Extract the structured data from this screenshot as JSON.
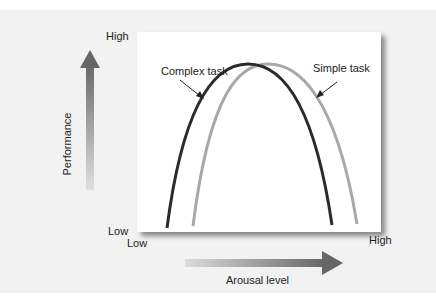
{
  "diagram": {
    "y_axis": {
      "label": "Performance",
      "high": "High",
      "low": "Low"
    },
    "x_axis": {
      "label": "Arousal level",
      "low": "Low",
      "high": "High"
    },
    "curves": [
      {
        "name": "Complex task",
        "color": "#2b2b2b",
        "peak_position": "lower arousal"
      },
      {
        "name": "Simple task",
        "color": "#a8a8a8",
        "peak_position": "higher arousal"
      }
    ],
    "colors": {
      "arrow": "#6b6b6b",
      "background": "#f2f2f2",
      "panel": "#ffffff"
    }
  }
}
